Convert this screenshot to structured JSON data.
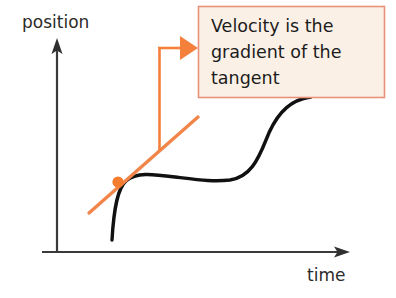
{
  "diagram": {
    "title_alt": "position-time graph with tangent illustrating velocity",
    "axes": {
      "y_label": "position",
      "x_label": "time"
    },
    "callout": {
      "lines": [
        "Velocity is the",
        "gradient of the",
        "tangent"
      ],
      "line1": "Velocity is the",
      "line2": "gradient of the",
      "line3": "tangent",
      "background_color": "#faf0e6",
      "border_color": "#e8927c"
    },
    "colors": {
      "curve": "#111111",
      "axis": "#3a3a3a",
      "accent_orange": "#f4803c",
      "tangent": "#f2854a",
      "point": "#f47c2e",
      "text": "#1c1c1c",
      "background": "#ffffff"
    },
    "elements": {
      "curve_name": "position-time-curve",
      "tangent_name": "tangent-line",
      "point_name": "tangent-point",
      "connector_name": "callout-connector",
      "arrow_name": "callout-arrowhead"
    }
  }
}
